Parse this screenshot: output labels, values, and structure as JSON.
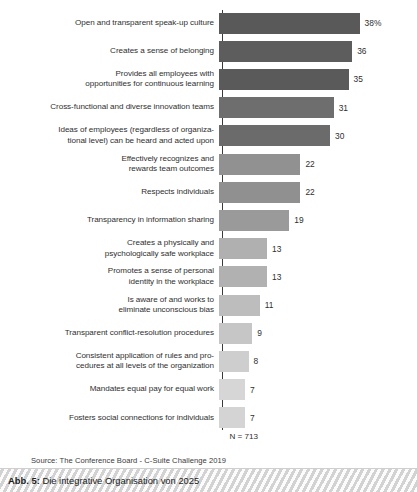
{
  "figure": {
    "caption_label": "Abb. 5:",
    "caption_title": "Die integrative Organisation von 2025",
    "sample_size": "N = 713",
    "source": "Source: The Conference Board - C-Suite Challenge 2019"
  },
  "chart_data": {
    "type": "bar",
    "orientation": "horizontal",
    "title": "",
    "subtitle": "",
    "xlabel": "",
    "ylabel": "",
    "xlim": [
      0,
      40
    ],
    "grid": false,
    "legend": false,
    "axis_line": true,
    "sample_size": "N = 713",
    "source": "Source: The Conference Board - C-Suite Challenge 2019",
    "categories": [
      "Open and transparent speak-up culture",
      "Creates a sense of belonging",
      "Provides all employees with\nopportunities for continuous learning",
      "Cross-functional and diverse innovation teams",
      "Ideas of employees (regardless of organiza-\ntional level) can be heard and acted upon",
      "Effectively recognizes and\nrewards team outcomes",
      "Respects individuals",
      "Transparency in information sharing",
      "Creates a physically and\npsychologically safe workplace",
      "Promotes a sense of personal\nidentity in the workplace",
      "Is aware of and works to\neliminate unconscious bias",
      "Transparent conflict-resolution procedures",
      "Consistent application of rules and pro-\ncedures at all levels of the organization",
      "Mandates equal pay for equal work",
      "Fosters social connections for individuals"
    ],
    "values": [
      38,
      36,
      35,
      31,
      30,
      22,
      22,
      19,
      13,
      13,
      11,
      9,
      8,
      7,
      7
    ],
    "value_labels": [
      "38%",
      "36",
      "35",
      "31",
      "30",
      "22",
      "22",
      "19",
      "13",
      "13",
      "11",
      "9",
      "8",
      "7",
      "7"
    ],
    "bar_colors": [
      "#595959",
      "#5d5d5d",
      "#5a5a5a",
      "#6e6e6e",
      "#6b6b6b",
      "#919191",
      "#909090",
      "#9a9a9a",
      "#b0b0b0",
      "#b1b1b1",
      "#bdbdbd",
      "#c6c6c6",
      "#cecece",
      "#d6d6d6",
      "#d4d4d4"
    ],
    "rows": [
      {
        "label": "Open and transparent speak-up culture",
        "value": 38,
        "value_label": "38%",
        "color": "#595959",
        "lines": 1
      },
      {
        "label": "Creates a sense of belonging",
        "value": 36,
        "value_label": "36",
        "color": "#5d5d5d",
        "lines": 1
      },
      {
        "label": "Provides all employees with\nopportunities for continuous learning",
        "value": 35,
        "value_label": "35",
        "color": "#5a5a5a",
        "lines": 2
      },
      {
        "label": "Cross-functional and diverse innovation teams",
        "value": 31,
        "value_label": "31",
        "color": "#6e6e6e",
        "lines": 1
      },
      {
        "label": "Ideas of employees (regardless of organiza-\ntional level) can be heard and acted upon",
        "value": 30,
        "value_label": "30",
        "color": "#6b6b6b",
        "lines": 2
      },
      {
        "label": "Effectively recognizes and\nrewards team outcomes",
        "value": 22,
        "value_label": "22",
        "color": "#919191",
        "lines": 2
      },
      {
        "label": "Respects individuals",
        "value": 22,
        "value_label": "22",
        "color": "#909090",
        "lines": 1
      },
      {
        "label": "Transparency in information sharing",
        "value": 19,
        "value_label": "19",
        "color": "#9a9a9a",
        "lines": 1
      },
      {
        "label": "Creates a physically and\npsychologically safe workplace",
        "value": 13,
        "value_label": "13",
        "color": "#b0b0b0",
        "lines": 2
      },
      {
        "label": "Promotes a sense of personal\nidentity in the workplace",
        "value": 13,
        "value_label": "13",
        "color": "#b1b1b1",
        "lines": 2
      },
      {
        "label": "Is aware of and works to\neliminate unconscious bias",
        "value": 11,
        "value_label": "11",
        "color": "#bdbdbd",
        "lines": 2
      },
      {
        "label": "Transparent conflict-resolution procedures",
        "value": 9,
        "value_label": "9",
        "color": "#c6c6c6",
        "lines": 1
      },
      {
        "label": "Consistent application of rules and pro-\ncedures at all levels of the organization",
        "value": 8,
        "value_label": "8",
        "color": "#cecece",
        "lines": 2
      },
      {
        "label": "Mandates equal pay for equal work",
        "value": 7,
        "value_label": "7",
        "color": "#d6d6d6",
        "lines": 1
      },
      {
        "label": "Fosters social connections for individuals",
        "value": 7,
        "value_label": "7",
        "color": "#d4d4d4",
        "lines": 1
      }
    ]
  },
  "layout": {
    "axis_x_px": 222,
    "bar_px_per_unit": 3.7,
    "bar_height_px": 21,
    "row_pitch_px": 28.2,
    "first_row_center_px": 23
  }
}
